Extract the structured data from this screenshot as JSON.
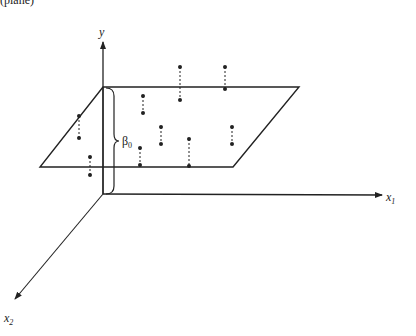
{
  "caption_fragment": "(plane)",
  "axes": {
    "y": {
      "label": "y"
    },
    "x1": {
      "label": "x",
      "subscript": "1"
    },
    "x2": {
      "label": "x",
      "subscript": "2"
    }
  },
  "intercept": {
    "label": "β",
    "subscript": "0"
  },
  "colors": {
    "ink": "#222222",
    "background": "#ffffff"
  },
  "plane": {
    "corners": [
      [
        103,
        87
      ],
      [
        299,
        87
      ],
      [
        233,
        167
      ],
      [
        40,
        167
      ]
    ]
  },
  "residuals": [
    {
      "point": [
        79,
        116
      ],
      "foot": [
        79,
        138
      ]
    },
    {
      "point": [
        90,
        157
      ],
      "foot": [
        90,
        175
      ]
    },
    {
      "point": [
        143,
        96
      ],
      "foot": [
        143,
        113
      ]
    },
    {
      "point": [
        180,
        67
      ],
      "foot": [
        180,
        100
      ]
    },
    {
      "point": [
        225,
        67
      ],
      "foot": [
        225,
        89
      ]
    },
    {
      "point": [
        161,
        127
      ],
      "foot": [
        161,
        144
      ]
    },
    {
      "point": [
        140,
        148
      ],
      "foot": [
        140,
        165
      ]
    },
    {
      "point": [
        189,
        139
      ],
      "foot": [
        189,
        166
      ]
    },
    {
      "point": [
        232,
        127
      ],
      "foot": [
        232,
        144
      ]
    }
  ]
}
